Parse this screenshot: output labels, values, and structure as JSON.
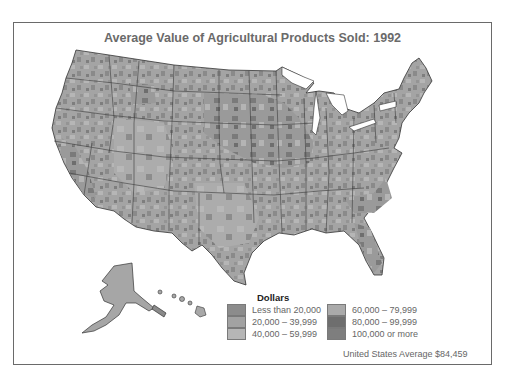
{
  "top_text_fragment": "Figure continued from previous page",
  "map": {
    "title": "Average Value of Agricultural Products Sold: 1992",
    "region": "United States (counties), with Alaska and Hawaii insets",
    "legend": {
      "title": "Dollars",
      "items": [
        {
          "label": "Less than 20,000",
          "color": "#8c8c8c"
        },
        {
          "label": "20,000 – 39,999",
          "color": "#a2a2a2"
        },
        {
          "label": "40,000 – 59,999",
          "color": "#b6b6b6"
        },
        {
          "label": "60,000 – 79,999",
          "color": "#aaaaaa"
        },
        {
          "label": "80,000 – 99,999",
          "color": "#6e6e6e"
        },
        {
          "label": "100,000 or more",
          "color": "#7e7e7e"
        }
      ]
    },
    "average_note": "United States Average $84,459"
  }
}
